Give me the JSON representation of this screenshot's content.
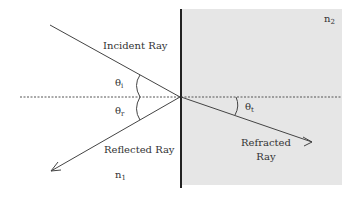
{
  "diagram": {
    "media": {
      "medium1": {
        "label_base": "n",
        "label_sub": "1",
        "fill": "#ffffff"
      },
      "medium2": {
        "label_base": "n",
        "label_sub": "2",
        "fill": "#e6e6e6"
      }
    },
    "rays": {
      "incident": {
        "label": "Incident Ray"
      },
      "reflected": {
        "label": "Reflected Ray"
      },
      "refracted": {
        "label_line1": "Refracted",
        "label_line2": "Ray"
      }
    },
    "angles": {
      "incidence": {
        "base": "θ",
        "sub": "i"
      },
      "reflection": {
        "base": "θ",
        "sub": "r"
      },
      "transmission": {
        "base": "θ",
        "sub": "t"
      }
    },
    "colors": {
      "ray": "#444444",
      "interface": "#222222",
      "normal": "#555555",
      "medium2_fill": "#e6e6e6"
    }
  }
}
